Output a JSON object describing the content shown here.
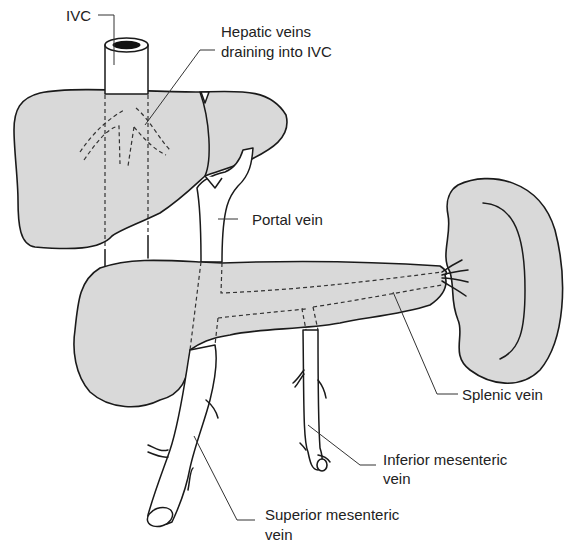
{
  "diagram": {
    "labels": {
      "ivc": "IVC",
      "hepatic_veins_line1": "Hepatic veins",
      "hepatic_veins_line2": "draining into IVC",
      "portal_vein": "Portal vein",
      "splenic_vein": "Splenic vein",
      "inferior_mesenteric_line1": "Inferior mesenteric",
      "inferior_mesenteric_line2": "vein",
      "superior_mesenteric_line1": "Superior mesenteric",
      "superior_mesenteric_line2": "vein"
    },
    "structures": [
      "liver",
      "inferior vena cava",
      "hepatic veins",
      "portal vein",
      "pancreas",
      "spleen",
      "splenic vein",
      "inferior mesenteric vein",
      "superior mesenteric vein"
    ],
    "colors": {
      "organ_fill": "#d9d9d9",
      "outline": "#1a1a1a",
      "background": "#ffffff"
    }
  }
}
